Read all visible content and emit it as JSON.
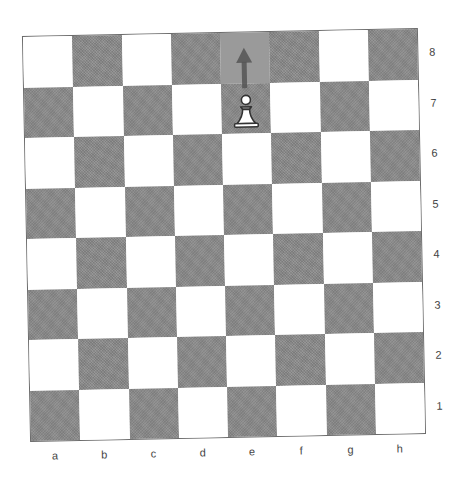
{
  "diagram": {
    "type": "chess-board",
    "files": [
      "a",
      "b",
      "c",
      "d",
      "e",
      "f",
      "g",
      "h"
    ],
    "ranks": [
      "8",
      "7",
      "6",
      "5",
      "4",
      "3",
      "2",
      "1"
    ],
    "colors": {
      "light": "#ffffff",
      "dark": "#8a8a8a",
      "highlight": "#9a9a9a",
      "border": "#6a6a6a",
      "label": "#444444",
      "arrow": "#555555"
    },
    "pieces": [
      {
        "square": "e7",
        "piece": "pawn",
        "color": "white"
      }
    ],
    "highlighted_squares": [
      "e8"
    ],
    "arrows": [
      {
        "from": "e7",
        "to": "e8"
      }
    ]
  }
}
